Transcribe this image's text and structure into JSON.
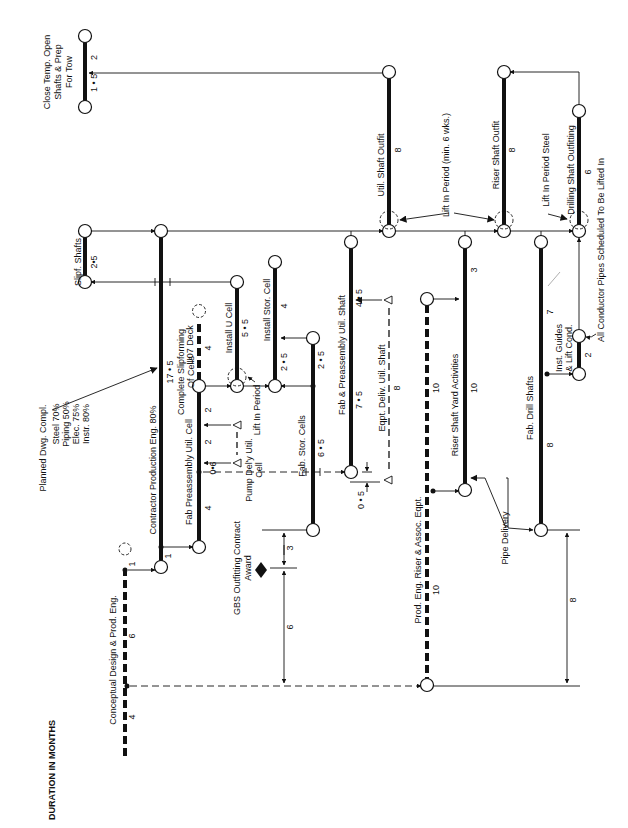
{
  "title": "DURATION IN MONTHS",
  "colors": {
    "ink": "#111111",
    "background": "#ffffff"
  },
  "nodes": [
    {
      "id": "n_close_top",
      "x": 85,
      "y": 36
    },
    {
      "id": "n_close_bot",
      "x": 85,
      "y": 107
    },
    {
      "id": "n_slipf_top",
      "x": 85,
      "y": 231
    },
    {
      "id": "n_slipf_bot",
      "x": 85,
      "y": 282
    },
    {
      "id": "n_contract_top",
      "x": 161,
      "y": 231
    },
    {
      "id": "n_util_outfit_top",
      "x": 389,
      "y": 72
    },
    {
      "id": "n_util_outfit_bot",
      "x": 389,
      "y": 231
    },
    {
      "id": "n_riser_outfit_top",
      "x": 504,
      "y": 72
    },
    {
      "id": "n_riser_outfit_bot",
      "x": 504,
      "y": 231
    },
    {
      "id": "n_drill_outfit_top",
      "x": 579,
      "y": 111
    },
    {
      "id": "n_drill_outfit_bot",
      "x": 579,
      "y": 231
    },
    {
      "id": "n_installu_top",
      "x": 237,
      "y": 282
    },
    {
      "id": "n_installu_bot",
      "x": 237,
      "y": 386
    },
    {
      "id": "n_installstor_top",
      "x": 275,
      "y": 262
    },
    {
      "id": "n_installstor_bot",
      "x": 275,
      "y": 386
    },
    {
      "id": "n_fabstor_top",
      "x": 313,
      "y": 338
    },
    {
      "id": "n_fabstor_bot",
      "x": 313,
      "y": 530
    },
    {
      "id": "n_fabutilshaft_top",
      "x": 351,
      "y": 242
    },
    {
      "id": "n_fabutilshaft_bot",
      "x": 351,
      "y": 472
    },
    {
      "id": "n_complete_top",
      "x": 199,
      "y": 386
    },
    {
      "id": "n_fabpre_bot",
      "x": 199,
      "y": 547
    },
    {
      "id": "n_contract_bot",
      "x": 161,
      "y": 567
    },
    {
      "id": "n_riseryard_top",
      "x": 465,
      "y": 242
    },
    {
      "id": "n_riseryard_bot",
      "x": 465,
      "y": 490
    },
    {
      "id": "n_prodeng_top",
      "x": 427,
      "y": 299
    },
    {
      "id": "n_prodeng_bot",
      "x": 427,
      "y": 685
    },
    {
      "id": "n_fabdrill_top",
      "x": 541,
      "y": 242
    },
    {
      "id": "n_fabdrill_bot",
      "x": 541,
      "y": 530
    },
    {
      "id": "n_instguides_top",
      "x": 579,
      "y": 336
    },
    {
      "id": "n_instguides_bot",
      "x": 579,
      "y": 374
    }
  ],
  "activities": [
    {
      "label": "Close Temp. Open",
      "label2": "Shafts & Prep",
      "label3": "For Tow",
      "durations": [
        "2",
        "1 • 5"
      ],
      "style": "solid"
    },
    {
      "label": "Slipf. Shafts",
      "duration": "2•5",
      "style": "solid"
    },
    {
      "label": "Contractor Production Eng. 80%",
      "durations": [
        "17 • 5",
        "1"
      ],
      "style": "solid"
    },
    {
      "label": "Util. Shaft Outfit",
      "duration": "8",
      "style": "solid"
    },
    {
      "label": "Riser Shaft Outfit",
      "duration": "8",
      "style": "solid"
    },
    {
      "label": "Drilling Shaft Outfitting",
      "duration": "6",
      "style": "solid"
    },
    {
      "label": "Install U Cell",
      "duration": "5 • 5",
      "style": "solid"
    },
    {
      "label": "Install Stor. Cell",
      "durations": [
        "4",
        "2 • 5"
      ],
      "style": "solid"
    },
    {
      "label": "Fab. Stor. Cells",
      "durations": [
        "2 • 5",
        "6 • 5"
      ],
      "style": "solid"
    },
    {
      "label": "Fab & Preassembly Util. Shaft",
      "durations": [
        "4 • 5",
        "7 • 5"
      ],
      "style": "solid"
    },
    {
      "label": "Complete Slipforming",
      "label2": "Of Cells",
      "durations": [
        "2",
        "2",
        "4"
      ],
      "style": "solid"
    },
    {
      "label": "Fab Preassembly Util. Cell",
      "style": "solid"
    },
    {
      "label": "U07 Deck",
      "duration": "4",
      "style": "dashed"
    },
    {
      "label": "Riser Shaft Yard Activities",
      "durations": [
        "3",
        "10"
      ],
      "style": "solid"
    },
    {
      "label": "Prod. Eng. Riser & Assoc. Eqpt.",
      "durations": [
        "10",
        "10"
      ],
      "style": "dashed"
    },
    {
      "label": "Fab. Drill Shafts",
      "durations": [
        "7",
        "8"
      ],
      "style": "solid"
    },
    {
      "label": "Inst. Guides",
      "label2": "& Lift Cond.",
      "duration": "2",
      "style": "solid"
    },
    {
      "label": "Conceptual Design & Prod. Eng.",
      "durations": [
        "1",
        "6",
        "4"
      ],
      "style": "dashed"
    },
    {
      "label": "Eqpt. Deliv. Util. Shaft",
      "duration": "8",
      "style": "dashed"
    },
    {
      "label": "Pump Del'y Util.",
      "label2": "Cell",
      "duration": "0•6",
      "style": "dashed"
    }
  ],
  "annotations": {
    "planned": {
      "title": "Planned Dwg. Compl.",
      "lines": [
        "Steel 70%",
        "Piping 50%",
        "Elec. 75%",
        "Instr. 80%"
      ]
    },
    "lift_in_period_main": "Lift In Period (min. 6 wks.)",
    "lift_in_period_steel": "Lift In Period Steel",
    "lift_in_period_cell": "Lift In Period",
    "all_conductor": "All Conductor Pipes Scheduled To Be Lifted In",
    "pipe_delivery": "Pipe Delivery",
    "gbs_award": {
      "line1": "GBS Outfitting Contract",
      "line2": "Award"
    },
    "dim_3": "3",
    "dim_6": "6",
    "dim_8": "8",
    "dim_05": "0 • 5"
  }
}
